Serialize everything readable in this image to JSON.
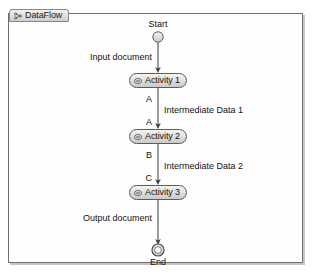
{
  "diagram": {
    "tab": {
      "label": "DataFlow",
      "icon": "linked-nodes-icon"
    },
    "nodes": [
      {
        "id": "start",
        "type": "initial-node",
        "label": "Start",
        "icon": "circle-node-icon"
      },
      {
        "id": "activity1",
        "type": "activity-node",
        "label": "Activity 1",
        "icon": "collapsed-minus-icon"
      },
      {
        "id": "activity2",
        "type": "activity-node",
        "label": "Activity 2",
        "icon": "collapsed-minus-icon"
      },
      {
        "id": "activity3",
        "type": "activity-node",
        "label": "Activity 3",
        "icon": "collapsed-minus-icon"
      },
      {
        "id": "end",
        "type": "final-node",
        "label": "End",
        "icon": "ring-node-icon"
      }
    ],
    "edge_labels": [
      {
        "id": "input-document",
        "text": "Input document",
        "side": "left"
      },
      {
        "id": "pin-a-out-1",
        "text": "A",
        "side": "left"
      },
      {
        "id": "intermediate-data-1",
        "text": "Intermediate Data 1",
        "side": "right"
      },
      {
        "id": "pin-a-in-2",
        "text": "A",
        "side": "left"
      },
      {
        "id": "pin-b-out-2",
        "text": "B",
        "side": "left"
      },
      {
        "id": "intermediate-data-2",
        "text": "Intermediate Data 2",
        "side": "right"
      },
      {
        "id": "pin-c-in-3",
        "text": "C",
        "side": "left"
      },
      {
        "id": "output-document",
        "text": "Output document",
        "side": "left"
      }
    ],
    "colors": {
      "frame_border": "#6f6f72",
      "canvas_background": "#fefefe",
      "node_fill_light": "#f4f4f2",
      "node_fill_dark": "#c9c9c6",
      "node_stroke": "#5d5d61",
      "connector": "#4a4a4d",
      "text": "#111111"
    }
  }
}
